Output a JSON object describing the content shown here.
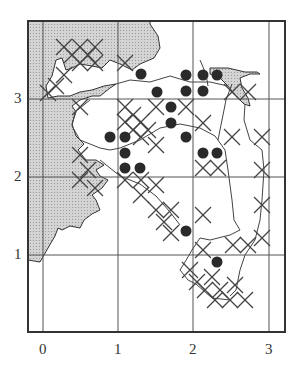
{
  "map": {
    "x_axis": {
      "ticks": [
        "0",
        "1",
        "2",
        "3"
      ]
    },
    "y_axis": {
      "ticks": [
        "1",
        "2",
        "3"
      ]
    },
    "colors": {
      "frame": "#333333",
      "grid": "#555555",
      "land_shading": "#c8c8c8",
      "dot": "#2a2a2a",
      "cross": "#444444"
    },
    "legend_symbols": {
      "dot": "filled-circle-record",
      "cross": "x-cross-record"
    },
    "dots": [
      {
        "x": 141,
        "y": 74
      },
      {
        "x": 157,
        "y": 92
      },
      {
        "x": 186,
        "y": 75
      },
      {
        "x": 203,
        "y": 75
      },
      {
        "x": 217,
        "y": 75
      },
      {
        "x": 186,
        "y": 91
      },
      {
        "x": 203,
        "y": 91
      },
      {
        "x": 171,
        "y": 107
      },
      {
        "x": 171,
        "y": 123
      },
      {
        "x": 110,
        "y": 137
      },
      {
        "x": 125,
        "y": 137
      },
      {
        "x": 125,
        "y": 153
      },
      {
        "x": 125,
        "y": 168
      },
      {
        "x": 140,
        "y": 168
      },
      {
        "x": 186,
        "y": 137
      },
      {
        "x": 203,
        "y": 153
      },
      {
        "x": 217,
        "y": 153
      },
      {
        "x": 186,
        "y": 231
      },
      {
        "x": 217,
        "y": 262
      }
    ],
    "crosses": [
      {
        "x": 64,
        "y": 47
      },
      {
        "x": 80,
        "y": 47
      },
      {
        "x": 95,
        "y": 47
      },
      {
        "x": 72,
        "y": 55
      },
      {
        "x": 88,
        "y": 55
      },
      {
        "x": 80,
        "y": 63
      },
      {
        "x": 95,
        "y": 63
      },
      {
        "x": 125,
        "y": 63
      },
      {
        "x": 48,
        "y": 93
      },
      {
        "x": 56,
        "y": 86
      },
      {
        "x": 64,
        "y": 75
      },
      {
        "x": 80,
        "y": 107
      },
      {
        "x": 125,
        "y": 107
      },
      {
        "x": 133,
        "y": 115
      },
      {
        "x": 125,
        "y": 122
      },
      {
        "x": 141,
        "y": 122
      },
      {
        "x": 156,
        "y": 107
      },
      {
        "x": 148,
        "y": 130
      },
      {
        "x": 133,
        "y": 130
      },
      {
        "x": 156,
        "y": 145
      },
      {
        "x": 141,
        "y": 137
      },
      {
        "x": 186,
        "y": 107
      },
      {
        "x": 203,
        "y": 123
      },
      {
        "x": 232,
        "y": 137
      },
      {
        "x": 232,
        "y": 92
      },
      {
        "x": 248,
        "y": 92
      },
      {
        "x": 262,
        "y": 137
      },
      {
        "x": 141,
        "y": 180
      },
      {
        "x": 125,
        "y": 180
      },
      {
        "x": 156,
        "y": 185
      },
      {
        "x": 80,
        "y": 155
      },
      {
        "x": 88,
        "y": 170
      },
      {
        "x": 80,
        "y": 180
      },
      {
        "x": 95,
        "y": 188
      },
      {
        "x": 141,
        "y": 195
      },
      {
        "x": 156,
        "y": 210
      },
      {
        "x": 171,
        "y": 210
      },
      {
        "x": 164,
        "y": 222
      },
      {
        "x": 171,
        "y": 233
      },
      {
        "x": 203,
        "y": 215
      },
      {
        "x": 203,
        "y": 168
      },
      {
        "x": 218,
        "y": 168
      },
      {
        "x": 203,
        "y": 250
      },
      {
        "x": 233,
        "y": 245
      },
      {
        "x": 248,
        "y": 245
      },
      {
        "x": 262,
        "y": 238
      },
      {
        "x": 262,
        "y": 205
      },
      {
        "x": 262,
        "y": 170
      },
      {
        "x": 190,
        "y": 270
      },
      {
        "x": 205,
        "y": 290
      },
      {
        "x": 220,
        "y": 290
      },
      {
        "x": 235,
        "y": 285
      },
      {
        "x": 245,
        "y": 300
      },
      {
        "x": 230,
        "y": 300
      },
      {
        "x": 215,
        "y": 300
      },
      {
        "x": 212,
        "y": 277
      },
      {
        "x": 197,
        "y": 282
      }
    ]
  }
}
